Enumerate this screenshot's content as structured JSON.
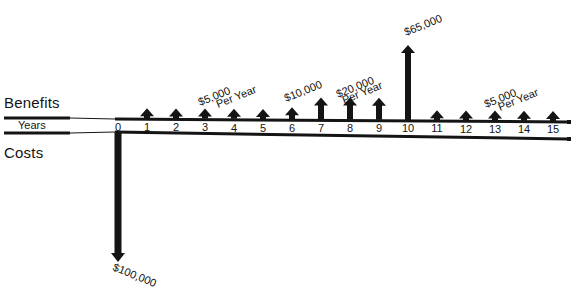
{
  "diagram": {
    "labels": {
      "benefits": "Benefits",
      "costs": "Costs",
      "axis": "Years"
    },
    "colors": {
      "ink": "#141414",
      "background": "#ffffff"
    },
    "axis": {
      "years": [
        0,
        1,
        2,
        3,
        4,
        5,
        6,
        7,
        8,
        9,
        10,
        11,
        12,
        13,
        14,
        15
      ],
      "origin_x": 118,
      "step_px": 29,
      "top_line_y": 118,
      "bottom_line_y": 133
    },
    "benefits": [
      {
        "year": 1,
        "amount": 5000
      },
      {
        "year": 2,
        "amount": 5000
      },
      {
        "year": 3,
        "amount": 5000
      },
      {
        "year": 4,
        "amount": 5000
      },
      {
        "year": 5,
        "amount": 5000
      },
      {
        "year": 6,
        "amount": 10000
      },
      {
        "year": 7,
        "amount": 20000
      },
      {
        "year": 8,
        "amount": 20000
      },
      {
        "year": 9,
        "amount": 20000
      },
      {
        "year": 10,
        "amount": 65000
      },
      {
        "year": 11,
        "amount": 5000
      },
      {
        "year": 12,
        "amount": 5000
      },
      {
        "year": 13,
        "amount": 5000
      },
      {
        "year": 14,
        "amount": 5000
      },
      {
        "year": 15,
        "amount": 5000
      }
    ],
    "costs": [
      {
        "year": 0,
        "amount": 100000
      }
    ],
    "annotations": [
      {
        "text": "$5,000",
        "x": 200,
        "y": 106,
        "rotate": -22
      },
      {
        "text": "Per Year",
        "x": 218,
        "y": 108,
        "rotate": -22
      },
      {
        "text": "$10,000",
        "x": 286,
        "y": 102,
        "rotate": -22
      },
      {
        "text": "$20,000",
        "x": 338,
        "y": 98,
        "rotate": -22
      },
      {
        "text": "Per Year",
        "x": 344,
        "y": 104,
        "rotate": -22
      },
      {
        "text": "$65,000",
        "x": 406,
        "y": 36,
        "rotate": -22
      },
      {
        "text": "$5,000",
        "x": 486,
        "y": 108,
        "rotate": -22
      },
      {
        "text": "Per Year",
        "x": 500,
        "y": 111,
        "rotate": -22
      },
      {
        "text": "$100,000",
        "x": 112,
        "y": 270,
        "rotate": 22
      }
    ]
  },
  "chart_data": {
    "type": "bar",
    "title": "",
    "xlabel": "Years",
    "ylabel": "",
    "categories": [
      "0",
      "1",
      "2",
      "3",
      "4",
      "5",
      "6",
      "7",
      "8",
      "9",
      "10",
      "11",
      "12",
      "13",
      "14",
      "15"
    ],
    "series": [
      {
        "name": "Benefits",
        "values": [
          0,
          5000,
          5000,
          5000,
          5000,
          5000,
          10000,
          20000,
          20000,
          20000,
          65000,
          5000,
          5000,
          5000,
          5000,
          5000
        ]
      },
      {
        "name": "Costs",
        "values": [
          100000,
          0,
          0,
          0,
          0,
          0,
          0,
          0,
          0,
          0,
          0,
          0,
          0,
          0,
          0,
          0
        ]
      }
    ],
    "annotations": [
      "$5,000 Per Year (years 1-5)",
      "$10,000 (year 6)",
      "$20,000 Per Year (years 7-9)",
      "$65,000 (year 10)",
      "$5,000 Per Year (years 11-15)",
      "$100,000 (year 0 cost)"
    ],
    "grid": false,
    "legend": "none"
  }
}
